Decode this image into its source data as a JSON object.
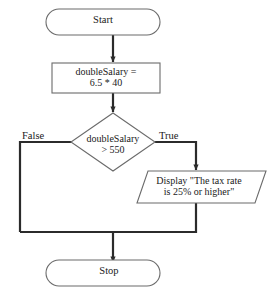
{
  "diagram": {
    "colors": {
      "shape_stroke": "#6b6b6b",
      "connector_stroke": "#2b2b2b",
      "text": "#1a1a1a",
      "background": "#ffffff"
    },
    "nodes": {
      "start": {
        "shape": "terminal",
        "label": "Start"
      },
      "process": {
        "shape": "process",
        "label_line1": "doubleSalary =",
        "label_line2": "6.5 * 40"
      },
      "decision": {
        "shape": "decision",
        "label_line1": "doubleSalary",
        "label_line2": "> 550"
      },
      "output": {
        "shape": "input-output",
        "label_line1": "Display \"The tax rate",
        "label_line2": "is 25% or higher\""
      },
      "stop": {
        "shape": "terminal",
        "label": "Stop"
      }
    },
    "edges": {
      "false_label": "False",
      "true_label": "True"
    }
  }
}
